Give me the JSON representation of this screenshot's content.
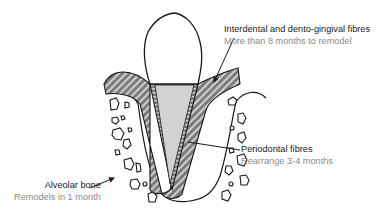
{
  "diagram": {
    "colors": {
      "outline": "#1a1a1a",
      "root_fill": "#d2d2d2",
      "hatch_fill": "#7c7c7c",
      "hatch_stripe": "#cfcfcf",
      "title_text": "#1a1a1a",
      "sub_text": "#8a8a8a"
    },
    "labels": [
      {
        "id": "gingival",
        "title": "Interdental and dento-gingival fibres",
        "subtitle": "More than 8 months to remodel"
      },
      {
        "id": "periodontal",
        "title": "Periodontal fibres",
        "subtitle": "Rearrange 3-4 months"
      },
      {
        "id": "alveolar",
        "title": "Alveolar bone",
        "subtitle": "Remodels in 1 month"
      }
    ]
  }
}
